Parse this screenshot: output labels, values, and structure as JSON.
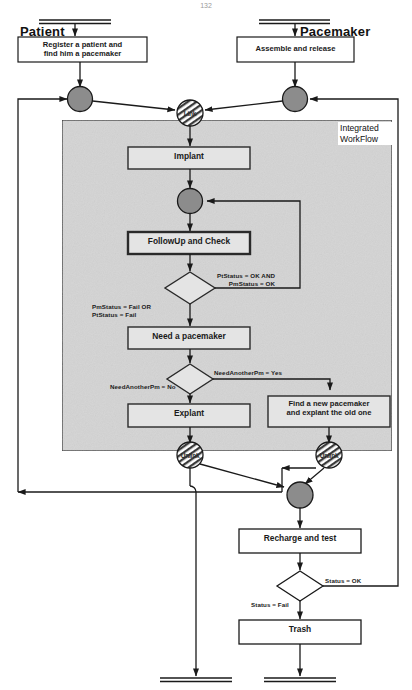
{
  "diagram": {
    "type": "activity-workflow-diagram",
    "page_number": "132",
    "panel": {
      "title_line1": "Integrated",
      "title_line2": "WorkFlow"
    },
    "swimlanes": [
      {
        "id": "patient",
        "label": "Patient"
      },
      {
        "id": "pacemaker",
        "label": "Pacemaker"
      }
    ],
    "activities": [
      {
        "id": "register",
        "line1": "Register a patient and",
        "line2": "find him a pacemaker"
      },
      {
        "id": "assemble",
        "line1": "Assemble and release",
        "line2": ""
      },
      {
        "id": "implant",
        "line1": "Implant",
        "line2": ""
      },
      {
        "id": "followup",
        "line1": "FollowUp and Check",
        "line2": ""
      },
      {
        "id": "need-pacemaker",
        "line1": "Need a pacemaker",
        "line2": ""
      },
      {
        "id": "explant",
        "line1": "Explant",
        "line2": ""
      },
      {
        "id": "find-new",
        "line1": "Find a new pacemaker",
        "line2": "and explant the old one"
      },
      {
        "id": "recharge",
        "line1": "Recharge and test",
        "line2": ""
      },
      {
        "id": "trash",
        "line1": "Trash",
        "line2": ""
      }
    ],
    "sync_nodes": [
      {
        "id": "link",
        "label": "Link"
      },
      {
        "id": "unlink-left",
        "label": "Unlink"
      },
      {
        "id": "unlink-right",
        "label": "Unlink"
      }
    ],
    "guards": [
      {
        "id": "pt-pm-ok",
        "line1": "PtStatus = OK AND",
        "line2": "PmStatus = OK"
      },
      {
        "id": "pm-pt-fail",
        "line1": "PmStatus = Fail OR",
        "line2": "PtStatus = Fail"
      },
      {
        "id": "need-another-yes",
        "line1": "NeedAnotherPm = Yes",
        "line2": ""
      },
      {
        "id": "need-another-no",
        "line1": "NeedAnotherPm = No",
        "line2": ""
      },
      {
        "id": "status-ok",
        "line1": "Status = OK",
        "line2": ""
      },
      {
        "id": "status-fail",
        "line1": "Status = Fail",
        "line2": ""
      }
    ],
    "colors": {
      "panel_fill": "#d4d4d4",
      "merge_fill": "#8c8c8c",
      "stroke": "#1a1a1a",
      "box_fill": "#e0e0e0",
      "page_bg": "#ffffff"
    }
  }
}
